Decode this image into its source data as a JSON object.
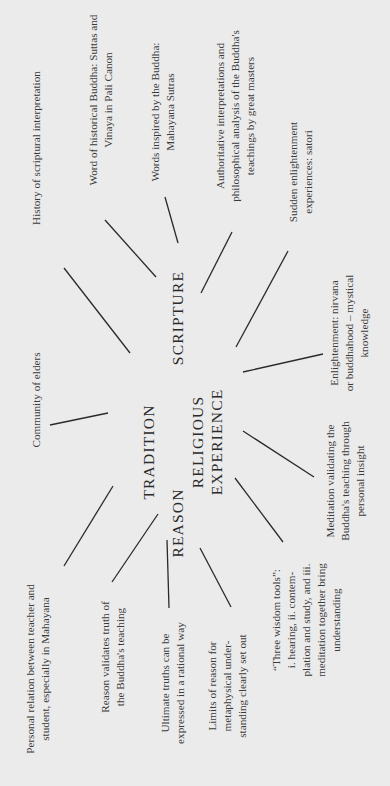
{
  "diagram": {
    "orientation": "rotated-90-ccw",
    "background": "#ebebeb",
    "hubs": {
      "tradition": "TRADITION",
      "scripture": "SCRIPTURE",
      "religious_experience": [
        "RELIGIOUS",
        "EXPERIENCE"
      ],
      "reason": "REASON"
    },
    "leaves": {
      "history": [
        "History of scriptural interpretation"
      ],
      "historical_buddha": [
        "Word of historical Buddha: Suttas and",
        "Vinaya in Pali Canon"
      ],
      "inspired": [
        "Words inspired by the Buddha:",
        "Mahayana Sutras"
      ],
      "authoritative": [
        "Authoritative interpretations and",
        "philosophical analysis of the Buddha's",
        "teachings by great masters"
      ],
      "satori": [
        "Sudden enlightenment",
        "experiences: satori"
      ],
      "community": [
        "Community of elders"
      ],
      "enlightenment": [
        "Enlightenment: nirvana",
        "or buddhahood – mystical",
        "knowledge"
      ],
      "meditation": [
        "Meditation validating the",
        "Buddha's teaching through",
        "personal insight"
      ],
      "personal_relation": [
        "Personal relation between teacher and",
        "student, especially in  Mahayana"
      ],
      "reason_validates": [
        "Reason validates truth of",
        "the Buddha's teaching"
      ],
      "ultimate_truths": [
        "Ultimate truths can be",
        "expressed in a rational way"
      ],
      "limits": [
        "Limits of reason for",
        "metaphysical under-",
        "standing clearly set out"
      ],
      "three_tools": [
        "“Three wisdom tools”:",
        "i. hearing, ii. contem-",
        "plation and study, and iii.",
        "meditation together bring",
        "understanding"
      ]
    }
  }
}
